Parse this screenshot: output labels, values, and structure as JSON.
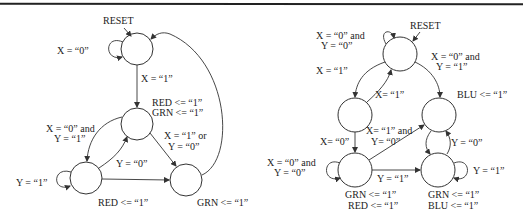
{
  "left_diagram": {
    "reset_label": "RESET",
    "labels": {
      "self_loop_top": "X =  “0”",
      "top_to_mid": "X =  “1”",
      "mid_out_1": "RED <= “1”",
      "mid_out_2": "GRN <= “1”",
      "mid_to_bl_1": "X =  “0”  and",
      "mid_to_bl_2": "Y =  “1”",
      "mid_to_br_1": "X =  “1”  or",
      "mid_to_br_2": "Y =  “0”",
      "bl_to_mid": "Y =  “0”",
      "bl_self": "Y =  “1”",
      "bl_out": "RED <= “1”",
      "br_out": "GRN <=  “1”"
    }
  },
  "right_diagram": {
    "reset_label": "RESET",
    "labels": {
      "top_self_1": "X =  “0”  and",
      "top_self_2": "Y =  “0”",
      "top_to_ml": "X =  “1”",
      "top_to_mr_1": "X =  “0”  and",
      "top_to_mr_2": "Y =  “1”",
      "ml_to_top": "X= “1”",
      "mr_out": "BLU <= “1”",
      "ml_to_bl": "X= “0”",
      "bl_to_mr_1": "X= “1”  and",
      "bl_to_mr_2": "Y= “0”",
      "bl_self_1": "X =  “0”  and",
      "bl_self_2": "Y =  “0”",
      "bl_to_br": "Y =  “1”",
      "br_to_mr": "Y = “0”",
      "br_self": "Y =  “1”",
      "bl_out_1": "GRN <=  “1”",
      "bl_out_2": "RED <= “1”",
      "br_out_1": "GRN <= “1”",
      "br_out_2": "BLU <= “1”"
    }
  }
}
